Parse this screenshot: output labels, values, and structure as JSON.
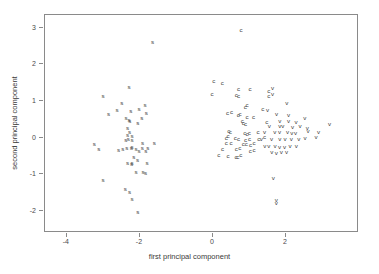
{
  "chart_data": {
    "type": "scatter",
    "title": "",
    "xlabel": "first principal component",
    "ylabel": "second principal component",
    "xlim": [
      -4.6,
      4.0
    ],
    "ylim": [
      -2.6,
      3.35
    ],
    "xticks": [
      -4,
      -2,
      0,
      2
    ],
    "xticklabels": [
      "-4",
      "-2",
      "0",
      "2"
    ],
    "yticks": [
      -2,
      -1,
      0,
      1,
      2,
      3
    ],
    "yticklabels": [
      "-2",
      "-1",
      "0",
      "1",
      "2",
      "3"
    ],
    "grid": false,
    "legend": false,
    "marker_style": "text-glyph",
    "series": [
      {
        "name": "s",
        "marker": "s",
        "color": "#3a3a3a",
        "points": [
          [
            -1.63,
            2.58
          ],
          [
            -2.98,
            1.1
          ],
          [
            -2.27,
            1.35
          ],
          [
            -2.47,
            0.93
          ],
          [
            -2.83,
            0.63
          ],
          [
            -2.6,
            0.72
          ],
          [
            -2.22,
            0.7
          ],
          [
            -2.0,
            0.77
          ],
          [
            -1.83,
            0.86
          ],
          [
            -1.8,
            0.65
          ],
          [
            -2.35,
            0.52
          ],
          [
            -2.27,
            0.47
          ],
          [
            -2.25,
            0.43
          ],
          [
            -1.92,
            0.52
          ],
          [
            -2.03,
            0.38
          ],
          [
            -2.31,
            0.24
          ],
          [
            -2.26,
            0.13
          ],
          [
            -2.31,
            0.05
          ],
          [
            -2.19,
            0.02
          ],
          [
            -2.29,
            -0.06
          ],
          [
            -2.36,
            -0.1
          ],
          [
            -2.19,
            -0.1
          ],
          [
            -3.22,
            -0.2
          ],
          [
            -1.9,
            -0.18
          ],
          [
            -1.58,
            -0.17
          ],
          [
            -2.19,
            -0.28
          ],
          [
            -2.33,
            -0.31
          ],
          [
            -2.21,
            -0.3
          ],
          [
            -2.44,
            -0.34
          ],
          [
            -2.08,
            -0.33
          ],
          [
            -1.91,
            -0.3
          ],
          [
            -1.76,
            -0.31
          ],
          [
            -3.1,
            -0.34
          ],
          [
            -2.56,
            -0.35
          ],
          [
            -2.0,
            -0.39
          ],
          [
            -1.81,
            -0.4
          ],
          [
            -2.14,
            -0.55
          ],
          [
            -2.04,
            -0.63
          ],
          [
            -2.31,
            -0.72
          ],
          [
            -2.2,
            -0.75
          ],
          [
            -2.19,
            -0.73
          ],
          [
            -1.78,
            -0.73
          ],
          [
            -2.08,
            -0.96
          ],
          [
            -1.89,
            -0.97
          ],
          [
            -1.82,
            -0.98
          ],
          [
            -2.98,
            -1.19
          ],
          [
            -2.37,
            -1.43
          ],
          [
            -2.26,
            -1.52
          ],
          [
            -2.19,
            -1.7
          ],
          [
            -2.03,
            -2.05
          ]
        ]
      },
      {
        "name": "c",
        "marker": "c",
        "color": "#3a3a3a",
        "points": [
          [
            0.8,
            2.92
          ],
          [
            0.05,
            1.52
          ],
          [
            0.28,
            1.48
          ],
          [
            0.0,
            1.17
          ],
          [
            0.73,
            1.31
          ],
          [
            1.04,
            1.3
          ],
          [
            1.56,
            1.26
          ],
          [
            0.67,
            1.14
          ],
          [
            0.73,
            1.12
          ],
          [
            1.56,
            1.12
          ],
          [
            0.96,
            0.88
          ],
          [
            0.91,
            0.81
          ],
          [
            1.39,
            0.77
          ],
          [
            0.54,
            0.68
          ],
          [
            0.43,
            0.65
          ],
          [
            0.77,
            0.63
          ],
          [
            0.96,
            0.55
          ],
          [
            0.72,
            0.58
          ],
          [
            1.14,
            0.53
          ],
          [
            0.83,
            0.42
          ],
          [
            0.86,
            0.38
          ],
          [
            0.92,
            0.34
          ],
          [
            1.5,
            0.41
          ],
          [
            0.46,
            0.15
          ],
          [
            0.5,
            0.12
          ],
          [
            0.9,
            0.11
          ],
          [
            0.96,
            0.08
          ],
          [
            1.02,
            0.09
          ],
          [
            1.26,
            0.12
          ],
          [
            0.44,
            0.03
          ],
          [
            0.39,
            -0.03
          ],
          [
            0.64,
            -0.03
          ],
          [
            0.73,
            -0.06
          ],
          [
            0.92,
            -0.08
          ],
          [
            1.03,
            -0.07
          ],
          [
            1.28,
            -0.06
          ],
          [
            1.44,
            0.0
          ],
          [
            0.39,
            -0.17
          ],
          [
            0.52,
            -0.17
          ],
          [
            0.86,
            -0.2
          ],
          [
            0.94,
            -0.2
          ],
          [
            1.06,
            -0.22
          ],
          [
            1.15,
            -0.18
          ],
          [
            0.29,
            -0.33
          ],
          [
            0.67,
            -0.33
          ],
          [
            0.76,
            -0.32
          ],
          [
            1.05,
            -0.38
          ],
          [
            1.15,
            -0.35
          ],
          [
            0.19,
            -0.51
          ],
          [
            0.44,
            -0.52
          ],
          [
            0.66,
            -0.55
          ],
          [
            0.71,
            -0.54
          ],
          [
            0.79,
            -0.51
          ]
        ]
      },
      {
        "name": "v",
        "marker": "v",
        "color": "#3a3a3a",
        "points": [
          [
            1.66,
            1.33
          ],
          [
            1.66,
            1.18
          ],
          [
            2.05,
            0.92
          ],
          [
            1.52,
            0.74
          ],
          [
            1.77,
            0.62
          ],
          [
            2.1,
            0.6
          ],
          [
            2.54,
            0.52
          ],
          [
            1.86,
            0.44
          ],
          [
            2.1,
            0.42
          ],
          [
            2.3,
            0.41
          ],
          [
            1.57,
            0.29
          ],
          [
            1.86,
            0.29
          ],
          [
            1.94,
            0.3
          ],
          [
            2.21,
            0.26
          ],
          [
            2.41,
            0.29
          ],
          [
            2.61,
            0.24
          ],
          [
            3.22,
            0.35
          ],
          [
            1.44,
            0.14
          ],
          [
            1.72,
            0.12
          ],
          [
            1.85,
            0.13
          ],
          [
            2.07,
            0.12
          ],
          [
            2.19,
            0.1
          ],
          [
            2.29,
            0.11
          ],
          [
            2.63,
            0.15
          ],
          [
            2.92,
            0.14
          ],
          [
            1.35,
            -0.06
          ],
          [
            1.63,
            -0.06
          ],
          [
            1.86,
            -0.06
          ],
          [
            2.0,
            -0.06
          ],
          [
            2.17,
            -0.07
          ],
          [
            2.38,
            -0.06
          ],
          [
            2.55,
            -0.03
          ],
          [
            2.85,
            -0.02
          ],
          [
            1.45,
            -0.25
          ],
          [
            1.56,
            -0.26
          ],
          [
            1.73,
            -0.24
          ],
          [
            1.85,
            -0.27
          ],
          [
            1.99,
            -0.27
          ],
          [
            2.14,
            -0.26
          ],
          [
            2.31,
            -0.24
          ],
          [
            1.64,
            -0.41
          ],
          [
            1.76,
            -0.44
          ],
          [
            1.9,
            -0.42
          ],
          [
            2.04,
            -0.43
          ],
          [
            1.68,
            -1.13
          ],
          [
            1.76,
            -1.73
          ],
          [
            1.76,
            -1.8
          ]
        ]
      }
    ]
  },
  "axes": {
    "x_label": "first principal component",
    "y_label": "second principal component"
  }
}
